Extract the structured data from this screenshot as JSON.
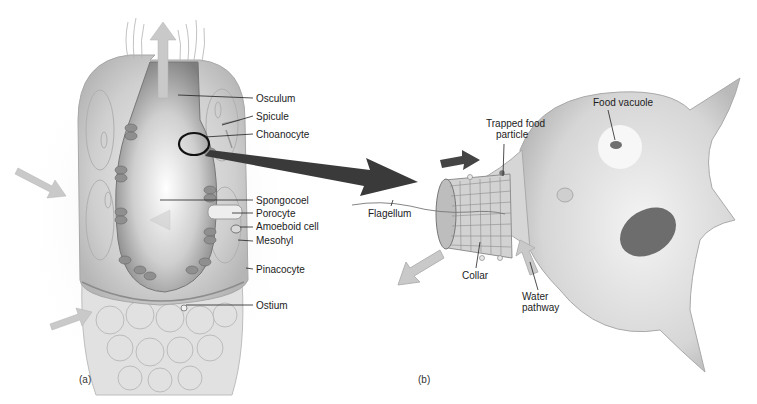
{
  "figure": {
    "panels": [
      {
        "id": "a",
        "label": "(a)",
        "subject": "Sponge body (cross section)"
      },
      {
        "id": "b",
        "label": "(b)",
        "subject": "Choanocyte (collar cell)"
      }
    ],
    "panel_a_labels": [
      {
        "id": "osculum",
        "text": "Osculum"
      },
      {
        "id": "spicule",
        "text": "Spicule"
      },
      {
        "id": "choanocyte",
        "text": "Choanocyte"
      },
      {
        "id": "spongocoel",
        "text": "Spongocoel"
      },
      {
        "id": "porocyte",
        "text": "Porocyte"
      },
      {
        "id": "amoeboid-cell",
        "text": "Amoeboid  cell"
      },
      {
        "id": "mesohyl",
        "text": "Mesohyl"
      },
      {
        "id": "pinacocyte",
        "text": "Pinacocyte"
      },
      {
        "id": "ostium",
        "text": "Ostium"
      }
    ],
    "panel_b_labels": [
      {
        "id": "trapped-food-particle",
        "text": "Trapped food\nparticle",
        "line1": "Trapped food",
        "line2": "particle"
      },
      {
        "id": "food-vacuole",
        "text": "Food vacuole"
      },
      {
        "id": "flagellum",
        "text": "Flagellum"
      },
      {
        "id": "collar",
        "text": "Collar"
      },
      {
        "id": "water-pathway",
        "text": "Water\npathway",
        "line1": "Water",
        "line2": "pathway"
      }
    ],
    "colors": {
      "body_fill": "#d9d9d9",
      "body_dark": "#8e8e8e",
      "spongocoel": "#f2f2f2",
      "flow_arrow": "#c9c9c9",
      "zoom_arrow": "#3a3a3a",
      "nucleus": "#6d6d6d",
      "cell_fill": "#e3e3e3"
    }
  }
}
